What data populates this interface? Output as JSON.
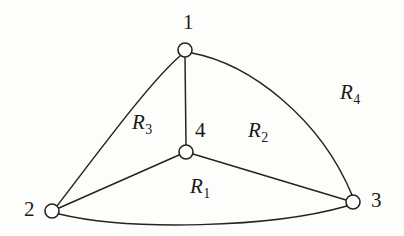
{
  "figure": {
    "type": "planar-graph-diagram",
    "background_color": "#fdfdfc",
    "ink_color": "#27241f"
  },
  "vertices": [
    {
      "id": "1",
      "label": "1",
      "cx": 185,
      "cy": 50,
      "r": 7,
      "label_x": 183,
      "label_y": 12
    },
    {
      "id": "2",
      "label": "2",
      "cx": 52,
      "cy": 211,
      "r": 7,
      "label_x": 24,
      "label_y": 199
    },
    {
      "id": "3",
      "label": "3",
      "cx": 353,
      "cy": 202,
      "r": 7,
      "label_x": 371,
      "label_y": 190
    },
    {
      "id": "4",
      "label": "4",
      "cx": 186,
      "cy": 152,
      "r": 7,
      "label_x": 195,
      "label_y": 120
    }
  ],
  "edges": [
    {
      "id": "e-1-2",
      "from": "1",
      "to": "2",
      "shape": "arc-outward-left"
    },
    {
      "id": "e-1-3",
      "from": "1",
      "to": "3",
      "shape": "arc-outward-right"
    },
    {
      "id": "e-2-3",
      "from": "2",
      "to": "3",
      "shape": "arc-outward-bottom"
    },
    {
      "id": "e-1-4",
      "from": "1",
      "to": "4",
      "shape": "straight-vertical"
    },
    {
      "id": "e-2-4",
      "from": "2",
      "to": "4",
      "shape": "straight"
    },
    {
      "id": "e-3-4",
      "from": "3",
      "to": "4",
      "shape": "straight"
    }
  ],
  "regions": [
    {
      "id": "R1",
      "base": "R",
      "sub": "1",
      "x": 190,
      "y": 176
    },
    {
      "id": "R2",
      "base": "R",
      "sub": "2",
      "x": 248,
      "y": 120
    },
    {
      "id": "R3",
      "base": "R",
      "sub": "3",
      "x": 132,
      "y": 112
    },
    {
      "id": "R4",
      "base": "R",
      "sub": "4",
      "x": 340,
      "y": 82
    }
  ]
}
